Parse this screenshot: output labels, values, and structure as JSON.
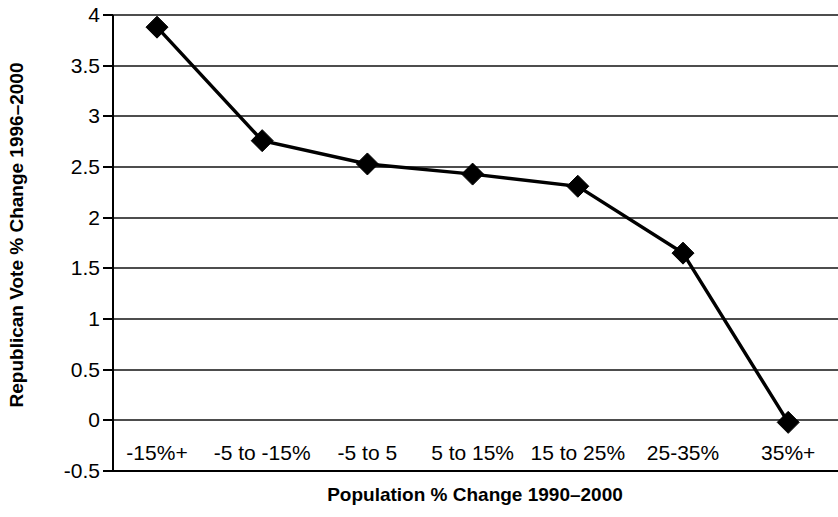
{
  "chart_data": {
    "type": "line",
    "title": "",
    "xlabel": "Population % Change 1990–2000",
    "ylabel": "Republican Vote % Change 1996–2000",
    "categories": [
      "-15%+",
      "-5 to -15%",
      "-5 to 5",
      "5 to 15%",
      "15 to 25%",
      "25-35%",
      "35%+"
    ],
    "values": [
      3.88,
      2.76,
      2.53,
      2.43,
      2.31,
      1.65,
      -0.02
    ],
    "series": [
      {
        "name": "Republican Vote % Change 1996–2000",
        "values": [
          3.88,
          2.76,
          2.53,
          2.43,
          2.31,
          1.65,
          -0.02
        ]
      }
    ],
    "ylim": [
      -0.5,
      4
    ],
    "ytick_labels": [
      "4",
      "3.5",
      "3",
      "2.5",
      "2",
      "1.5",
      "1",
      "0.5",
      "0",
      "-0.5"
    ],
    "ytick_values": [
      4,
      3.5,
      3,
      2.5,
      2,
      1.5,
      1,
      0.5,
      0,
      -0.5
    ],
    "grid": true,
    "legend": "none",
    "marker": "diamond",
    "line_color": "#000000",
    "marker_color": "#000000",
    "grid_color": "#4d4d4d",
    "background_color": "#ffffff"
  }
}
